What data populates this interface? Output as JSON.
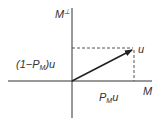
{
  "diagram": {
    "type": "vector-projection",
    "axes": {
      "vertical_label": "M",
      "vertical_label_superscript": "⊥",
      "horizontal_label": "M"
    },
    "vector": {
      "label": "u"
    },
    "labels": {
      "orthogonal_component_prefix": "(1−P",
      "orthogonal_component_sub": "M",
      "orthogonal_component_suffix": ")u",
      "projection_prefix": "P",
      "projection_sub": "M",
      "projection_suffix": "u"
    },
    "colors": {
      "axis": "#333333",
      "vector": "#333333",
      "dashed": "#555555"
    }
  }
}
